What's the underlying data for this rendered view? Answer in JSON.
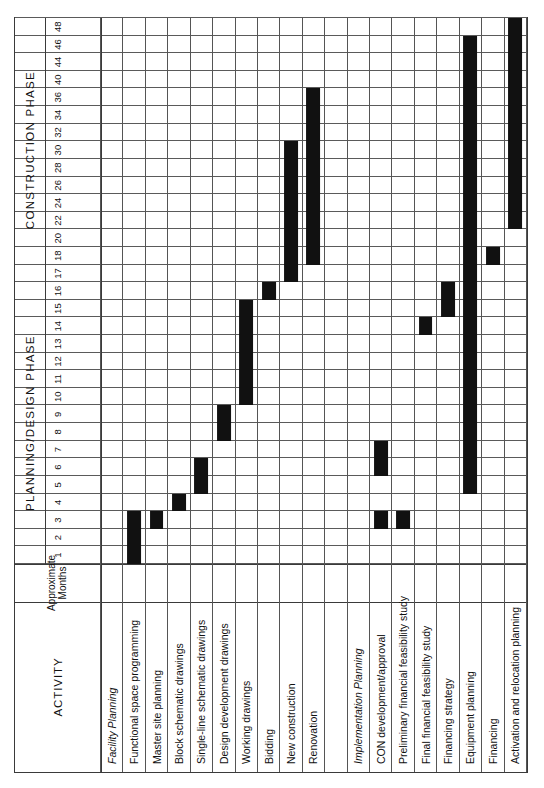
{
  "header": {
    "activity_label": "ACTIVITY",
    "months_label": "Approximate Months",
    "phases": [
      {
        "name": "PLANNING/DESIGN  PHASE",
        "from": 1,
        "to": 16
      },
      {
        "name": "CONSTRUCTION  PHASE",
        "from": 16,
        "to": 48
      }
    ]
  },
  "axis": {
    "title": "Approximate Months",
    "ticks": [
      1,
      2,
      3,
      4,
      5,
      6,
      7,
      8,
      9,
      10,
      11,
      12,
      13,
      14,
      15,
      16,
      17,
      18,
      20,
      22,
      24,
      26,
      28,
      30,
      32,
      34,
      36,
      40,
      44,
      46,
      48
    ],
    "min": 0,
    "max": 48
  },
  "colors": {
    "bar": "#111111",
    "rule": "#555555",
    "frame": "#3a3a3a",
    "background": "#ffffff",
    "text": "#111111"
  },
  "chart_data": {
    "type": "bar",
    "xlabel": "Approximate Months",
    "ylabel": "Activity",
    "xlim": [
      0,
      48
    ],
    "grid": true,
    "legend": null,
    "categories": [
      "Facility Planning",
      "Functional space programming",
      "Master site planning",
      "Block schematic drawings",
      "Single-line schematic drawings",
      "Design development drawings",
      "Working drawings",
      "Bidding",
      "New construction",
      "Renovation",
      "",
      "Implementation Planning",
      "CON development/approval",
      "Preliminary financial feasibility study",
      "Final financial feasibility study",
      "Financing strategy",
      "Equipment planning",
      "Financing",
      "Activation and relocation planning"
    ],
    "rows": [
      {
        "label": "Facility Planning",
        "group": true,
        "spacer": false,
        "bars": []
      },
      {
        "label": "Functional space programming",
        "group": false,
        "spacer": false,
        "bars": [
          {
            "start": 1,
            "end": 3
          }
        ]
      },
      {
        "label": "Master site planning",
        "group": false,
        "spacer": false,
        "bars": [
          {
            "start": 2,
            "end": 3
          }
        ]
      },
      {
        "label": "Block schematic drawings",
        "group": false,
        "spacer": false,
        "bars": [
          {
            "start": 3,
            "end": 4
          }
        ]
      },
      {
        "label": "Single-line schematic drawings",
        "group": false,
        "spacer": false,
        "bars": [
          {
            "start": 4,
            "end": 6
          }
        ]
      },
      {
        "label": "Design development drawings",
        "group": false,
        "spacer": false,
        "bars": [
          {
            "start": 7,
            "end": 9
          }
        ]
      },
      {
        "label": "Working drawings",
        "group": false,
        "spacer": false,
        "bars": [
          {
            "start": 9,
            "end": 15
          }
        ]
      },
      {
        "label": "Bidding",
        "group": false,
        "spacer": false,
        "bars": [
          {
            "start": 15,
            "end": 16
          }
        ]
      },
      {
        "label": "New construction",
        "group": false,
        "spacer": false,
        "bars": [
          {
            "start": 16,
            "end": 30
          }
        ]
      },
      {
        "label": "Renovation",
        "group": false,
        "spacer": false,
        "bars": [
          {
            "start": 17,
            "end": 36
          }
        ]
      },
      {
        "label": "",
        "group": false,
        "spacer": true,
        "bars": []
      },
      {
        "label": "Implementation Planning",
        "group": true,
        "spacer": false,
        "bars": []
      },
      {
        "label": "CON development/approval",
        "group": false,
        "spacer": false,
        "bars": [
          {
            "start": 2,
            "end": 3
          },
          {
            "start": 5,
            "end": 7
          }
        ]
      },
      {
        "label": "Preliminary financial feasibility study",
        "group": false,
        "spacer": false,
        "bars": [
          {
            "start": 2,
            "end": 3
          }
        ]
      },
      {
        "label": "Final financial feasibility study",
        "group": false,
        "spacer": false,
        "bars": [
          {
            "start": 13,
            "end": 14
          }
        ]
      },
      {
        "label": "Financing strategy",
        "group": false,
        "spacer": false,
        "bars": [
          {
            "start": 14,
            "end": 16
          }
        ]
      },
      {
        "label": "Equipment planning",
        "group": false,
        "spacer": false,
        "bars": [
          {
            "start": 4,
            "end": 46
          }
        ]
      },
      {
        "label": "Financing",
        "group": false,
        "spacer": false,
        "bars": [
          {
            "start": 17,
            "end": 18
          }
        ]
      },
      {
        "label": "Activation and relocation planning",
        "group": false,
        "spacer": false,
        "bars": [
          {
            "start": 20,
            "end": 48
          }
        ]
      }
    ]
  }
}
